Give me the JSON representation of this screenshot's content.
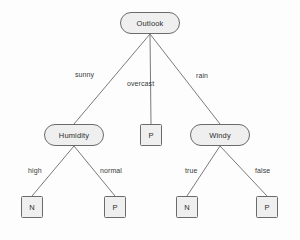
{
  "diagram": {
    "type": "decision-tree",
    "background_color": "#fdfdfd",
    "node_fill_color": "#efefef",
    "node_stroke_color": "#6b6b6b",
    "edge_color": "#7a7a7a",
    "text_color": "#2e2e2e"
  },
  "nodes": {
    "root": {
      "label": "Outlook",
      "shape": "stadium"
    },
    "humidity": {
      "label": "Humidity",
      "shape": "stadium"
    },
    "windy": {
      "label": "Windy",
      "shape": "stadium"
    },
    "leaf_overcast": {
      "label": "P",
      "shape": "square"
    },
    "leaf_high": {
      "label": "N",
      "shape": "square"
    },
    "leaf_normal": {
      "label": "P",
      "shape": "square"
    },
    "leaf_true": {
      "label": "N",
      "shape": "square"
    },
    "leaf_false": {
      "label": "P",
      "shape": "square"
    }
  },
  "edges": [
    {
      "from": "Outlook",
      "to": "Humidity",
      "label": "sunny"
    },
    {
      "from": "Outlook",
      "to": "P",
      "label": "overcast"
    },
    {
      "from": "Outlook",
      "to": "Windy",
      "label": "rain"
    },
    {
      "from": "Humidity",
      "to": "N",
      "label": "high"
    },
    {
      "from": "Humidity",
      "to": "P",
      "label": "normal"
    },
    {
      "from": "Windy",
      "to": "N",
      "label": "true"
    },
    {
      "from": "Windy",
      "to": "P",
      "label": "false"
    }
  ],
  "edge_labels": {
    "sunny": "sunny",
    "overcast": "overcast",
    "rain": "rain",
    "high": "high",
    "normal": "normal",
    "true": "true",
    "false": "false"
  }
}
